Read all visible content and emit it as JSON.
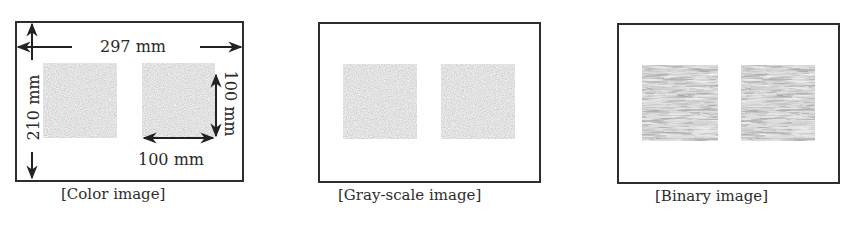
{
  "panels": [
    {
      "id": "color",
      "caption": "[Color image]"
    },
    {
      "id": "gray",
      "caption": "[Gray-scale image]"
    },
    {
      "id": "binary",
      "caption": "[Binary image]"
    }
  ],
  "dimensions": {
    "width_label": "297 mm",
    "height_label": "210 mm",
    "square_width_label": "100 mm",
    "square_height_label": "100 mm"
  },
  "colors": {
    "frame": "#2e2e2e",
    "gray_square": "#8c8c8c",
    "binary_dark": "#3a3a3a",
    "binary_light": "#d8d8d8"
  }
}
